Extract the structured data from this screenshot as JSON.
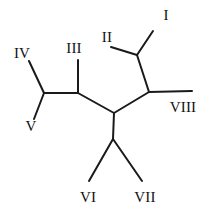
{
  "figure": {
    "kind": "unrooted-phylogenetic-tree",
    "background_color": "#ffffff",
    "line_color": "#1a1a1a",
    "label_color": "#111111",
    "line_width": 2,
    "width": 211,
    "height": 217
  },
  "labels": {
    "taxon_1": "I",
    "taxon_2": "II",
    "taxon_3": "III",
    "taxon_4": "IV",
    "taxon_5": "V",
    "taxon_6": "VI",
    "taxon_7": "VII",
    "taxon_8": "VIII"
  },
  "label_positions": [
    {
      "id": "taxon-label-i",
      "text_key": "taxon_1",
      "x": 166,
      "y": 15
    },
    {
      "id": "taxon-label-ii",
      "text_key": "taxon_2",
      "x": 107,
      "y": 37
    },
    {
      "id": "taxon-label-iii",
      "text_key": "taxon_3",
      "x": 74,
      "y": 48
    },
    {
      "id": "taxon-label-iv",
      "text_key": "taxon_4",
      "x": 22,
      "y": 53
    },
    {
      "id": "taxon-label-v",
      "text_key": "taxon_5",
      "x": 31,
      "y": 126
    },
    {
      "id": "taxon-label-vi",
      "text_key": "taxon_6",
      "x": 88,
      "y": 197
    },
    {
      "id": "taxon-label-vii",
      "text_key": "taxon_7",
      "x": 145,
      "y": 197
    },
    {
      "id": "taxon-label-viii",
      "text_key": "taxon_8",
      "x": 183,
      "y": 107
    }
  ],
  "nodes": {
    "center": {
      "x": 114,
      "y": 113
    },
    "node_iv_v": {
      "x": 44,
      "y": 93
    },
    "node_iii": {
      "x": 78,
      "y": 93
    },
    "node_i_ii": {
      "x": 137,
      "y": 55
    },
    "node_viii": {
      "x": 149,
      "y": 92
    },
    "node_vi_vii": {
      "x": 113,
      "y": 139
    }
  },
  "branches": [
    {
      "id": "branch-iv",
      "x1": 44,
      "y1": 93,
      "x2": 29,
      "y2": 61
    },
    {
      "id": "branch-v",
      "x1": 44,
      "y1": 93,
      "x2": 34,
      "y2": 119
    },
    {
      "id": "branch-internal-left",
      "x1": 44,
      "y1": 93,
      "x2": 78,
      "y2": 93
    },
    {
      "id": "branch-iii",
      "x1": 78,
      "y1": 93,
      "x2": 78,
      "y2": 60
    },
    {
      "id": "branch-internal-center-left",
      "x1": 78,
      "y1": 93,
      "x2": 114,
      "y2": 113
    },
    {
      "id": "branch-internal-center-right",
      "x1": 114,
      "y1": 113,
      "x2": 149,
      "y2": 92
    },
    {
      "id": "branch-internal-center-down",
      "x1": 114,
      "y1": 113,
      "x2": 113,
      "y2": 139
    },
    {
      "id": "branch-vi",
      "x1": 113,
      "y1": 139,
      "x2": 89,
      "y2": 181
    },
    {
      "id": "branch-vii",
      "x1": 113,
      "y1": 139,
      "x2": 142,
      "y2": 181
    },
    {
      "id": "branch-viii",
      "x1": 149,
      "y1": 92,
      "x2": 192,
      "y2": 91
    },
    {
      "id": "branch-internal-right-up",
      "x1": 149,
      "y1": 92,
      "x2": 137,
      "y2": 55
    },
    {
      "id": "branch-i",
      "x1": 137,
      "y1": 55,
      "x2": 153,
      "y2": 31
    },
    {
      "id": "branch-ii",
      "x1": 137,
      "y1": 55,
      "x2": 111,
      "y2": 47
    }
  ]
}
